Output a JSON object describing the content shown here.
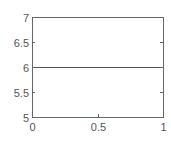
{
  "chart_data": {
    "type": "line",
    "title": "",
    "xlabel": "",
    "ylabel": "",
    "xlim": [
      0,
      1
    ],
    "ylim": [
      5,
      7
    ],
    "grid": false,
    "legend": null,
    "x_ticks": [
      0,
      0.5,
      1
    ],
    "x_tick_labels": [
      "0",
      "0.5",
      "1"
    ],
    "y_ticks": [
      5,
      5.5,
      6,
      6.5,
      7
    ],
    "y_tick_labels": [
      "5",
      "5.5",
      "6",
      "6.5",
      "7"
    ],
    "series": [
      {
        "name": "line",
        "x": [
          0,
          1
        ],
        "y": [
          6,
          6
        ],
        "color": "#555555"
      }
    ]
  },
  "style": {
    "axis_color": "#666666",
    "text_color": "#555555"
  }
}
